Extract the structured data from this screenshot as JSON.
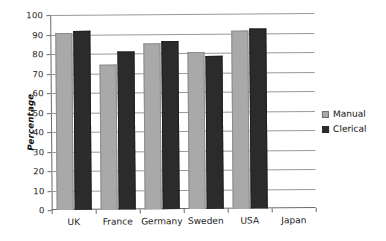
{
  "chart_data": {
    "type": "bar",
    "title": "",
    "xlabel": "",
    "ylabel": "Percentage",
    "ylim": [
      0,
      100
    ],
    "ytick_step": 10,
    "yticks": [
      100,
      90,
      80,
      70,
      60,
      50,
      40,
      30,
      20,
      10,
      0
    ],
    "grid": true,
    "legend_position": "right",
    "categories": [
      "UK",
      "France",
      "Germany",
      "Sweden",
      "USA",
      "Japan"
    ],
    "series": [
      {
        "name": "Manual",
        "color": "#a9a9a9",
        "values": [
          91,
          74.5,
          85,
          80.5,
          91.5,
          null
        ]
      },
      {
        "name": "Clerical",
        "color": "#2b2b2b",
        "values": [
          92,
          81,
          86,
          78.5,
          92.5,
          null
        ]
      }
    ]
  },
  "legend": {
    "items": [
      {
        "label": "Manual",
        "swatch": "manual-swatch-icon"
      },
      {
        "label": "Clerical",
        "swatch": "clerical-swatch-icon"
      }
    ]
  }
}
